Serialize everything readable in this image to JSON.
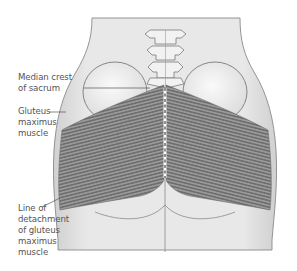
{
  "figure": {
    "colors": {
      "background": "#ffffff",
      "skin": "#e6e6e6",
      "skin_outline": "#8a8a8a",
      "muscle": "#8c8c8c",
      "muscle_line": "#5e5e5e",
      "bone": "#f2f2f2",
      "bone_outline": "#7a7a7a",
      "label_text": "#555555",
      "leader_line": "#555555"
    },
    "labels": [
      {
        "id": "median-crest",
        "text": "Median crest\nof sacrum"
      },
      {
        "id": "gluteus-maximus",
        "text": "Gluteus\nmaximus\nmuscle"
      },
      {
        "id": "line-of-detachment",
        "text": "Line of\ndetachment\nof gluteus\nmaximus\nmuscle"
      }
    ]
  }
}
